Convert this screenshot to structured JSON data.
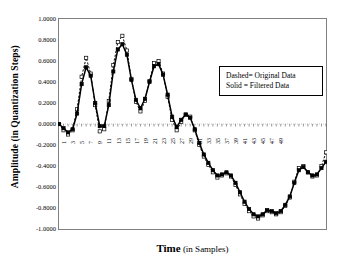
{
  "chart_data": {
    "type": "line",
    "title": "",
    "xlabel": "Time (in Samples)",
    "xlabel_bold_part": "Time",
    "xlabel_rest": " (in Samples)",
    "ylabel": "Amplitude (in Quantization Steps)",
    "ylabel_bold_part": "Amplitude",
    "ylabel_rest": " (in Quantization Steps)",
    "xlim": [
      1,
      50
    ],
    "ylim": [
      -1.0,
      1.0
    ],
    "grid": false,
    "zero_line": true,
    "legend_position": "upper-right-inside",
    "ytick_labels": [
      "1.0000",
      "0.8000",
      "0.6000",
      "0.4000",
      "0.2000",
      "0.0000",
      "-0.2000",
      "-0.4000",
      "-0.6000",
      "-0.8000",
      "-1.0000"
    ],
    "ytick_values": [
      1.0,
      0.8,
      0.6,
      0.4,
      0.2,
      0.0,
      -0.2,
      -0.4,
      -0.6,
      -0.8,
      -1.0
    ],
    "xtick_labels": [
      "1",
      "3",
      "5",
      "7",
      "9",
      "11",
      "13",
      "15",
      "17",
      "19",
      "21",
      "23",
      "25",
      "27",
      "29",
      "31",
      "33",
      "35",
      "37",
      "39",
      "41",
      "43",
      "45",
      "47",
      "49"
    ],
    "xtick_values": [
      1,
      3,
      5,
      7,
      9,
      11,
      13,
      15,
      17,
      19,
      21,
      23,
      25,
      27,
      29,
      31,
      33,
      35,
      37,
      39,
      41,
      43,
      45,
      47,
      49
    ],
    "x": [
      1,
      2,
      3,
      4,
      5,
      6,
      7,
      8,
      9,
      10,
      11,
      12,
      13,
      14,
      15,
      16,
      17,
      18,
      19,
      20,
      21,
      22,
      23,
      24,
      25,
      26,
      27,
      28,
      29,
      30,
      31,
      32,
      33,
      34,
      35,
      36,
      37,
      38,
      39,
      40,
      41,
      42,
      43,
      44,
      45,
      46,
      47,
      48,
      49,
      50
    ],
    "series": [
      {
        "name": "Original Data",
        "style": "dashed",
        "marker": "square-open",
        "values": [
          0.0,
          -0.06,
          -0.1,
          -0.06,
          0.14,
          0.45,
          0.63,
          0.48,
          0.18,
          -0.07,
          -0.05,
          0.22,
          0.56,
          0.78,
          0.84,
          0.7,
          0.43,
          0.21,
          0.12,
          0.22,
          0.41,
          0.58,
          0.6,
          0.48,
          0.26,
          0.04,
          -0.06,
          0.02,
          0.09,
          0.07,
          -0.06,
          -0.2,
          -0.31,
          -0.39,
          -0.46,
          -0.51,
          -0.49,
          -0.47,
          -0.5,
          -0.58,
          -0.67,
          -0.76,
          -0.83,
          -0.88,
          -0.9,
          -0.87,
          -0.83,
          -0.84,
          -0.86,
          -0.84
        ]
      },
      {
        "name": "Filtered Data",
        "style": "solid",
        "marker": "square-filled",
        "values": [
          0.0,
          -0.04,
          -0.08,
          -0.05,
          0.1,
          0.38,
          0.54,
          0.46,
          0.2,
          -0.02,
          -0.02,
          0.18,
          0.5,
          0.71,
          0.76,
          0.66,
          0.42,
          0.23,
          0.15,
          0.24,
          0.4,
          0.55,
          0.57,
          0.47,
          0.28,
          0.07,
          -0.03,
          0.04,
          0.09,
          0.06,
          -0.05,
          -0.18,
          -0.29,
          -0.37,
          -0.44,
          -0.49,
          -0.48,
          -0.46,
          -0.49,
          -0.56,
          -0.65,
          -0.74,
          -0.81,
          -0.86,
          -0.88,
          -0.86,
          -0.82,
          -0.83,
          -0.85,
          -0.83
        ]
      }
    ],
    "series_tail": {
      "note": "continuation of trace to x=50 region described by the visible curve",
      "x": [
        50,
        51,
        52,
        53,
        54,
        55,
        56,
        57,
        58,
        59,
        60
      ],
      "original": [
        -0.84,
        -0.78,
        -0.7,
        -0.55,
        -0.42,
        -0.4,
        -0.46,
        -0.5,
        -0.49,
        -0.4,
        -0.27
      ],
      "filtered": [
        -0.83,
        -0.77,
        -0.69,
        -0.56,
        -0.44,
        -0.41,
        -0.46,
        -0.49,
        -0.48,
        -0.42,
        -0.36
      ]
    }
  },
  "legend": {
    "dashed_entry": "Dashed= Original Data",
    "solid_entry": "Solid = Filtered Data"
  },
  "colors": {
    "line": "#000000",
    "frame": "#808080",
    "zero_line": "#b0b0b0",
    "background": "#ffffff"
  }
}
